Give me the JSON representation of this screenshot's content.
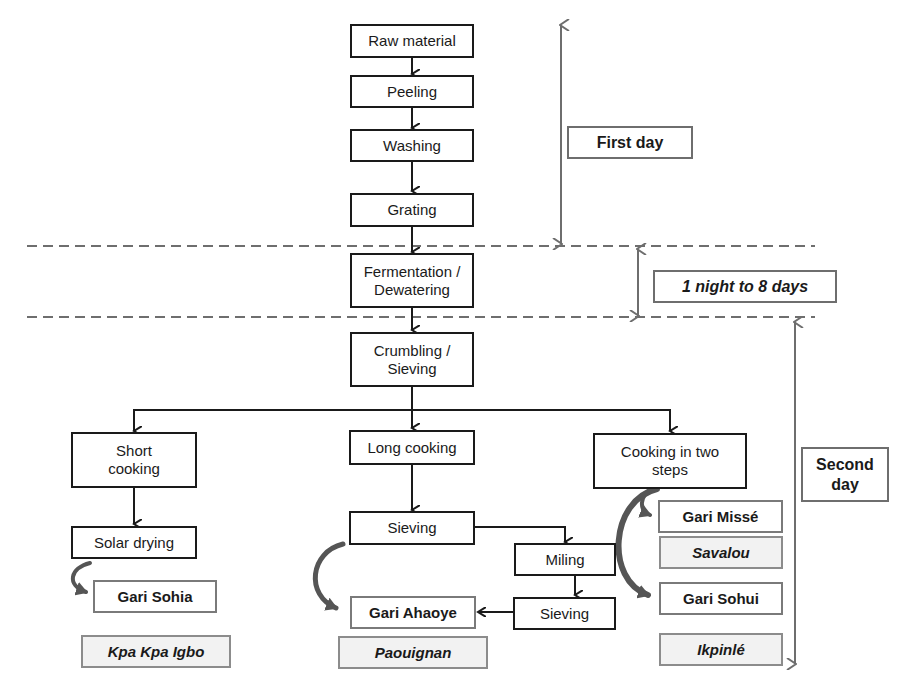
{
  "diagram": {
    "type": "flowchart",
    "topic": "Gari production process",
    "process_steps": {
      "raw_material": "Raw material",
      "peeling": "Peeling",
      "washing": "Washing",
      "grating": "Grating",
      "fermentation": "Fermentation / Dewatering",
      "crumbling": "Crumbling / Sieving"
    },
    "branches": {
      "short": {
        "cooking": "Short cooking",
        "drying": "Solar drying",
        "product": "Gari Sohia",
        "place": "Kpa Kpa Igbo"
      },
      "long": {
        "cooking": "Long cooking",
        "sieving1": "Sieving",
        "milling": "Miling",
        "sieving2": "Sieving",
        "product": "Gari Ahaoye",
        "place": "Paouignan"
      },
      "two_steps": {
        "cooking": "Cooking in two steps",
        "product1": "Gari Missé",
        "place1": "Savalou",
        "product2": "Gari Sohui",
        "place2": "Ikpinlé"
      }
    },
    "time_labels": {
      "first": "First day",
      "middle": "1 night to 8 days",
      "second": "Second day"
    },
    "colors": {
      "line": "#1a1a1a",
      "time_arrow": "#6e6e6e",
      "place_fill": "#f2f2f2",
      "curved_arrow": "#555555"
    }
  }
}
